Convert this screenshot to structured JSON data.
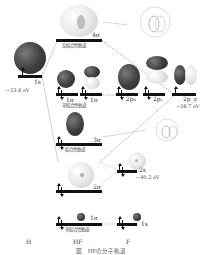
{
  "figure": {
    "columns": {
      "left": "H",
      "middle": "HF",
      "right": "F"
    },
    "caption": "図　HFの分子軌道",
    "h_atom": {
      "orbital": "1s",
      "energy": "−13.6 eV"
    },
    "f_atom": {
      "orbitals": [
        {
          "label": "2p_x",
          "display": "2pₓ"
        },
        {
          "label": "2p_y",
          "display": "2pᵧ"
        },
        {
          "label": "2p_z",
          "display": "2p_z"
        },
        {
          "label": "2s",
          "display": "2s"
        },
        {
          "label": "1s",
          "display": "1s"
        }
      ],
      "energy_2p": "−18.7 eV",
      "energy_2s": "−40.2 eV"
    },
    "mo_levels": [
      {
        "name": "4σ",
        "type": "反結合性軌道"
      },
      {
        "name": "1π",
        "type": "非結合性軌道"
      },
      {
        "name": "3σ",
        "type": "結合性軌道"
      },
      {
        "name": "2σ",
        "type": ""
      },
      {
        "name": "1σ",
        "type": "非結合性軌道"
      }
    ],
    "colors": {
      "level": "#111111",
      "dark_lobe": "#3e3e3e",
      "light_lobe": "#e6e6e6",
      "correlation_line": "#888888"
    }
  }
}
